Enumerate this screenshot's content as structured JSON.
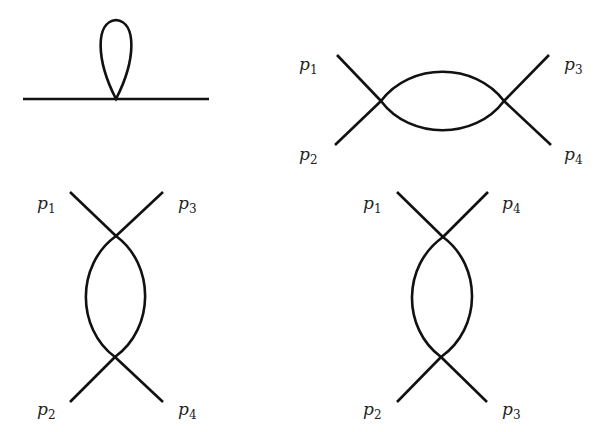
{
  "diagrams": [
    {
      "name": "tadpole-self-energy",
      "description": "One-loop tadpole diagram on a propagator line",
      "labels": []
    },
    {
      "name": "s-channel-bubble",
      "labels": {
        "top_left": {
          "p": "p",
          "sub": "1"
        },
        "bottom_left": {
          "p": "p",
          "sub": "2"
        },
        "top_right": {
          "p": "p",
          "sub": "3"
        },
        "bottom_right": {
          "p": "p",
          "sub": "4"
        }
      }
    },
    {
      "name": "t-channel-bubble",
      "labels": {
        "top_left": {
          "p": "p",
          "sub": "1"
        },
        "top_right": {
          "p": "p",
          "sub": "3"
        },
        "bottom_left": {
          "p": "p",
          "sub": "2"
        },
        "bottom_right": {
          "p": "p",
          "sub": "4"
        }
      }
    },
    {
      "name": "u-channel-bubble",
      "labels": {
        "top_left": {
          "p": "p",
          "sub": "1"
        },
        "top_right": {
          "p": "p",
          "sub": "4"
        },
        "bottom_left": {
          "p": "p",
          "sub": "2"
        },
        "bottom_right": {
          "p": "p",
          "sub": "3"
        }
      }
    }
  ]
}
